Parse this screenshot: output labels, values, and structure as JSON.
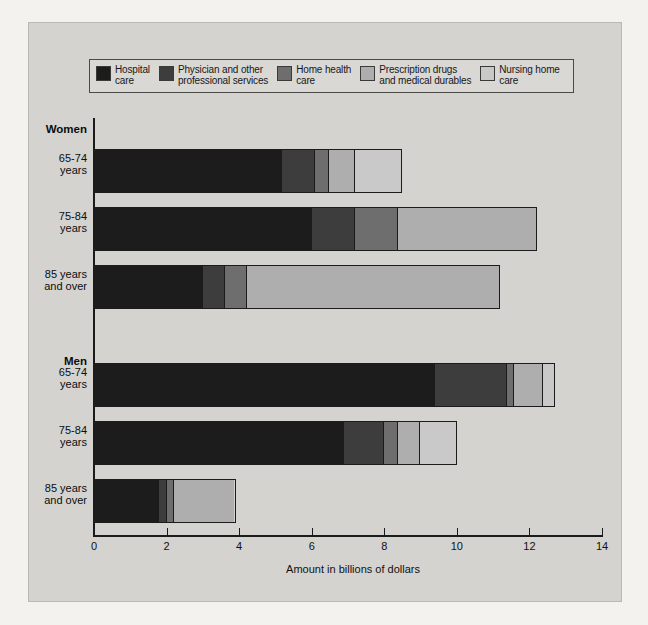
{
  "figure": {
    "xlabel": "Amount in billions of dollars",
    "bleed_text": [
      "Medicare has consistently been a source of care",
      "for the elderly and people under 65 with dis-",
      "abilities.",
      "is a period of rapid improvement in different health",
      "across the older age groups."
    ]
  },
  "legend": {
    "items": [
      {
        "label": "Hospital\ncare",
        "color": "#1c1c1c"
      },
      {
        "label": "Physician and other\nprofessional services",
        "color": "#3d3d3d"
      },
      {
        "label": "Home health\ncare",
        "color": "#6e6e6e"
      },
      {
        "label": "Prescription drugs\nand medical durables",
        "color": "#aeaeae"
      },
      {
        "label": "Nursing home\ncare",
        "color": "#c9c9c9"
      }
    ]
  },
  "chart_data": {
    "type": "bar",
    "orientation": "horizontal",
    "stacked": true,
    "title": "",
    "xlabel": "Amount in billions of dollars",
    "ylabel": "",
    "xlim": [
      0,
      14
    ],
    "xticks": [
      0,
      2,
      4,
      6,
      8,
      10,
      12,
      14
    ],
    "grid": false,
    "legend_position": "top",
    "series": [
      {
        "name": "Hospital care",
        "color": "#1c1c1c"
      },
      {
        "name": "Physician and other professional services",
        "color": "#3d3d3d"
      },
      {
        "name": "Home health care",
        "color": "#6e6e6e"
      },
      {
        "name": "Prescription drugs and medical durables",
        "color": "#aeaeae"
      },
      {
        "name": "Nursing home care",
        "color": "#c9c9c9"
      }
    ],
    "groups": [
      {
        "name": "Women",
        "categories": [
          {
            "label": "65-74\nyears",
            "values": [
              5.2,
              0.9,
              0.4,
              0.7,
              1.3
            ],
            "total": 8.5
          },
          {
            "label": "75-84\nyears",
            "values": [
              6.0,
              1.2,
              1.2,
              3.8,
              0.0
            ],
            "total": 12.2
          },
          {
            "label": "85 years\nand over",
            "values": [
              3.0,
              0.6,
              0.6,
              7.0,
              0.0
            ],
            "total": 11.2
          }
        ]
      },
      {
        "name": "Men",
        "categories": [
          {
            "label": "65-74\nyears",
            "values": [
              9.4,
              2.0,
              0.2,
              0.8,
              0.3
            ],
            "total": 12.7
          },
          {
            "label": "75-84\nyears",
            "values": [
              6.9,
              1.1,
              0.4,
              0.6,
              1.0
            ],
            "total": 10.0
          },
          {
            "label": "85 years\nand over",
            "values": [
              1.8,
              0.2,
              0.2,
              1.7,
              0.0
            ],
            "total": 3.9
          }
        ]
      }
    ]
  }
}
